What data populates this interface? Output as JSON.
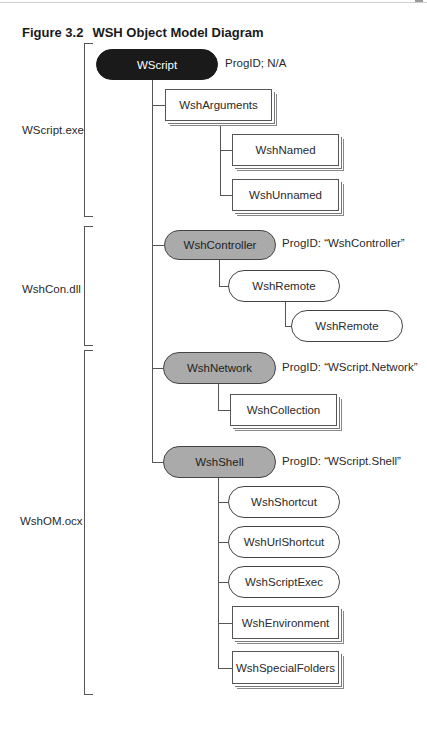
{
  "figure": {
    "number": "Figure 3.2",
    "title": "WSH Object Model Diagram"
  },
  "groups": [
    {
      "label": "WScript.exe"
    },
    {
      "label": "WshCon.dll"
    },
    {
      "label": "WshOM.ocx"
    }
  ],
  "nodes": {
    "wscript": {
      "label": "WScript",
      "progid": "ProgID; N/A",
      "style": "black-pill"
    },
    "wsharguments": {
      "label": "WshArguments",
      "style": "stacked-box"
    },
    "wshnamed": {
      "label": "WshNamed",
      "style": "stacked-box"
    },
    "wshunnamed": {
      "label": "WshUnnamed",
      "style": "stacked-box"
    },
    "wshcontroller": {
      "label": "WshController",
      "progid": "ProgID: “WshController”",
      "style": "gray-pill"
    },
    "wshremote1": {
      "label": "WshRemote",
      "style": "white-pill"
    },
    "wshremote2": {
      "label": "WshRemote",
      "style": "white-pill"
    },
    "wshnetwork": {
      "label": "WshNetwork",
      "progid": "ProgID: “WScript.Network”",
      "style": "gray-pill"
    },
    "wshcollection": {
      "label": "WshCollection",
      "style": "stacked-box"
    },
    "wshshell": {
      "label": "WshShell",
      "progid": "ProgID: “WScript.Shell”",
      "style": "gray-pill"
    },
    "wshshortcut": {
      "label": "WshShortcut",
      "style": "white-pill"
    },
    "wshurlshortcut": {
      "label": "WshUrlShortcut",
      "style": "white-pill"
    },
    "wshscriptexec": {
      "label": "WshScriptExec",
      "style": "white-pill"
    },
    "wshenvironment": {
      "label": "WshEnvironment",
      "style": "stacked-box"
    },
    "wshspecialfolders": {
      "label": "WshSpecialFolders",
      "style": "stacked-box"
    }
  },
  "colors": {
    "root_fill": "#1a1a1a",
    "creatable_fill": "#aaaaaa",
    "object_fill": "#ffffff",
    "lines": "#555555"
  }
}
